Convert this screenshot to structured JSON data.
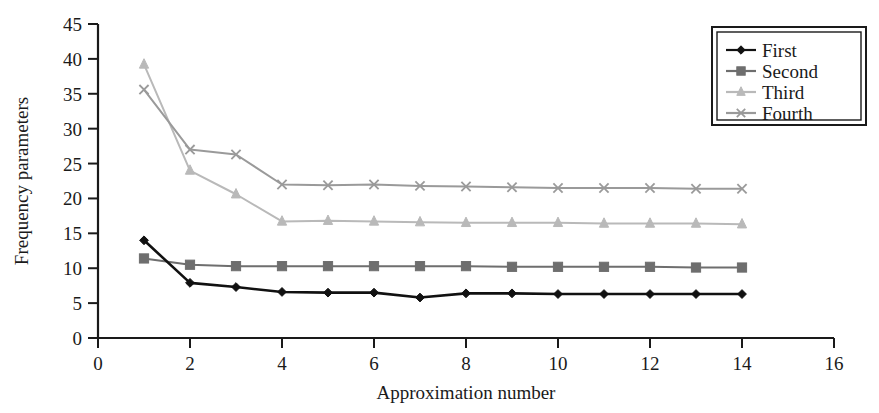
{
  "chart_data": {
    "type": "line",
    "title": "",
    "xlabel": "Approximation number",
    "ylabel": "Frequency parameters",
    "xlim": [
      0,
      16
    ],
    "ylim": [
      0,
      45
    ],
    "xticks": [
      0,
      2,
      4,
      6,
      8,
      10,
      12,
      14,
      16
    ],
    "yticks": [
      0,
      5,
      10,
      15,
      20,
      25,
      30,
      35,
      40,
      45
    ],
    "xtick_labels": [
      "0",
      "2",
      "4",
      "6",
      "8",
      "10",
      "12",
      "14",
      "16"
    ],
    "ytick_labels": [
      "0",
      "5",
      "10",
      "15",
      "20",
      "25",
      "30",
      "35",
      "40",
      "45"
    ],
    "grid": false,
    "legend_position": "top-right",
    "x": [
      1,
      2,
      3,
      4,
      5,
      6,
      7,
      8,
      9,
      10,
      11,
      12,
      13,
      14
    ],
    "series": [
      {
        "name": "First",
        "marker": "diamond",
        "color": "#111111",
        "values": [
          14.0,
          7.9,
          7.3,
          6.6,
          6.5,
          6.5,
          5.8,
          6.4,
          6.4,
          6.3,
          6.3,
          6.3,
          6.3,
          6.3
        ]
      },
      {
        "name": "Second",
        "marker": "square",
        "color": "#6e6e6e",
        "values": [
          11.4,
          10.5,
          10.3,
          10.3,
          10.3,
          10.3,
          10.3,
          10.3,
          10.2,
          10.2,
          10.2,
          10.2,
          10.1,
          10.1
        ]
      },
      {
        "name": "Third",
        "marker": "triangle",
        "color": "#b9b9b9",
        "values": [
          39.2,
          24.0,
          20.6,
          16.7,
          16.8,
          16.7,
          16.6,
          16.5,
          16.5,
          16.5,
          16.4,
          16.4,
          16.4,
          16.3
        ]
      },
      {
        "name": "Fourth",
        "marker": "cross",
        "color": "#9a9a9a",
        "values": [
          35.6,
          27.0,
          26.3,
          22.0,
          21.9,
          22.0,
          21.8,
          21.7,
          21.6,
          21.5,
          21.5,
          21.5,
          21.4,
          21.4
        ]
      }
    ]
  },
  "legend": {
    "items": [
      {
        "label": "First"
      },
      {
        "label": "Second"
      },
      {
        "label": "Third"
      },
      {
        "label": "Fourth"
      }
    ]
  },
  "axes": {
    "x_title": "Approximation number",
    "y_title": "Frequency parameters"
  }
}
